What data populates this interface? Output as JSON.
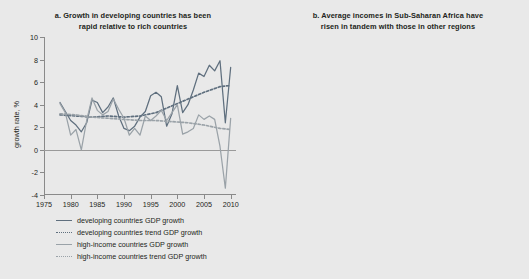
{
  "figure": {
    "background": "#e9e9e9",
    "colors": {
      "developing": "#5f6f7e",
      "developing_trend": "#5f6f7e",
      "high_income": "#9aa2a8",
      "high_income_trend": "#9aa2a8",
      "developing_ex_china_india": "#1a1a1a",
      "sub_saharan_africa": "#b8bfc4",
      "axis": "#8a8a8a"
    }
  },
  "panel_a": {
    "label": "a.",
    "title_line1": "Growth in developing countries has been",
    "title_line2": "rapid relative to rich countries",
    "ylabel": "growth rate, %",
    "legend": [
      {
        "name": "developing-gdp-growth",
        "label": "developing countries GDP growth",
        "style": "solid",
        "color": "#5f6f7e"
      },
      {
        "name": "developing-trend-gdp-growth",
        "label": "developing countries trend GDP growth",
        "style": "dotted",
        "color": "#5f6f7e"
      },
      {
        "name": "high-income-gdp-growth",
        "label": "high-income countries GDP growth",
        "style": "solid",
        "color": "#9aa2a8"
      },
      {
        "name": "high-income-trend-gdp-growth",
        "label": "high-income countries trend GDP growth",
        "style": "dotted",
        "color": "#9aa2a8"
      }
    ]
  },
  "panel_b": {
    "label": "b.",
    "title_line1": "Average incomes in Sub-Saharan Africa have",
    "title_line2": "risen in tandem with those in other regions",
    "ylabel": "% annual change",
    "legend": [
      {
        "name": "developing-countries",
        "label": "developing countries",
        "sub": "",
        "style": "solid",
        "color": "#5f6f7e"
      },
      {
        "name": "developing-countries-excluding-china-and-india",
        "label": "developing countries",
        "sub": "(excluding China and India)",
        "style": "dashed",
        "color": "#1a1a1a"
      },
      {
        "name": "sub-saharan-africa",
        "label": "Sub-Saharan Africa",
        "sub": "",
        "style": "solid",
        "color": "#b8bfc4"
      },
      {
        "name": "high-income-countries",
        "label": "high-income",
        "sub": "countries",
        "style": "solid",
        "color": "#9aa2a8"
      }
    ]
  },
  "chart_data": [
    {
      "type": "line",
      "id": "panel-a",
      "title": "a. Growth in developing countries has been rapid relative to rich countries",
      "xlabel": "",
      "ylabel": "growth rate, %",
      "xlim": [
        1975,
        2011
      ],
      "ylim": [
        -4,
        10
      ],
      "xticks": [
        1975,
        1980,
        1985,
        1990,
        1995,
        2000,
        2005,
        2010
      ],
      "yticks": [
        -4,
        -2,
        0,
        2,
        4,
        6,
        8,
        10
      ],
      "grid": false,
      "zero_line": true,
      "legend_position": "below",
      "series": [
        {
          "name": "developing countries GDP growth",
          "style": "solid",
          "color": "#5f6f7e",
          "x": [
            1978,
            1979,
            1980,
            1981,
            1982,
            1983,
            1984,
            1985,
            1986,
            1987,
            1988,
            1989,
            1990,
            1991,
            1992,
            1993,
            1994,
            1995,
            1996,
            1997,
            1998,
            1999,
            2000,
            2001,
            2002,
            2003,
            2004,
            2005,
            2006,
            2007,
            2008,
            2009,
            2010
          ],
          "values": [
            4.2,
            3.4,
            2.6,
            2.2,
            1.6,
            2.4,
            4.4,
            4.2,
            3.3,
            3.8,
            4.6,
            3.0,
            1.9,
            1.7,
            2.1,
            2.9,
            3.4,
            4.8,
            5.1,
            4.7,
            2.1,
            3.2,
            5.7,
            3.3,
            4.0,
            5.3,
            6.8,
            6.5,
            7.5,
            7.0,
            7.9,
            2.4,
            7.3
          ]
        },
        {
          "name": "developing countries trend GDP growth",
          "style": "dotted",
          "color": "#5f6f7e",
          "x": [
            1978,
            1981,
            1984,
            1987,
            1990,
            1993,
            1996,
            1999,
            2002,
            2005,
            2008,
            2010
          ],
          "values": [
            3.1,
            3.0,
            2.9,
            3.0,
            2.9,
            3.0,
            3.3,
            3.9,
            4.5,
            5.1,
            5.6,
            5.7
          ]
        },
        {
          "name": "high-income countries GDP growth",
          "style": "solid",
          "color": "#9aa2a8",
          "x": [
            1978,
            1979,
            1980,
            1981,
            1982,
            1983,
            1984,
            1985,
            1986,
            1987,
            1988,
            1989,
            1990,
            1991,
            1992,
            1993,
            1994,
            1995,
            1996,
            1997,
            1998,
            1999,
            2000,
            2001,
            2002,
            2003,
            2004,
            2005,
            2006,
            2007,
            2008,
            2009,
            2010
          ],
          "values": [
            4.1,
            3.3,
            1.3,
            1.8,
            0.0,
            2.6,
            4.6,
            3.5,
            3.1,
            3.4,
            4.5,
            3.6,
            2.8,
            1.3,
            1.9,
            1.3,
            3.0,
            2.6,
            3.0,
            3.5,
            2.6,
            3.3,
            4.0,
            1.4,
            1.6,
            1.9,
            3.1,
            2.7,
            3.0,
            2.7,
            0.3,
            -3.4,
            2.8
          ]
        },
        {
          "name": "high-income countries trend GDP growth",
          "style": "dotted",
          "color": "#9aa2a8",
          "x": [
            1978,
            1981,
            1984,
            1987,
            1990,
            1993,
            1996,
            1999,
            2002,
            2005,
            2008,
            2010
          ],
          "values": [
            3.2,
            3.1,
            2.9,
            2.8,
            2.7,
            2.6,
            2.6,
            2.5,
            2.4,
            2.2,
            1.9,
            1.8
          ]
        }
      ]
    },
    {
      "type": "line",
      "id": "panel-b",
      "title": "b. Average incomes in Sub-Saharan Africa have risen in tandem with those in other regions",
      "xlabel": "",
      "ylabel": "% annual change",
      "xlim": [
        1990,
        2010
      ],
      "ylim": [
        -4,
        8
      ],
      "xticks": [
        1990,
        1992,
        1994,
        1996,
        1998,
        2000,
        2002,
        2004,
        2006,
        2008,
        2010
      ],
      "yticks": [
        -4,
        -2,
        0,
        2,
        4,
        6,
        8
      ],
      "grid": false,
      "zero_line": true,
      "legend_position": "below",
      "series": [
        {
          "name": "developing countries",
          "style": "solid",
          "color": "#5f6f7e",
          "x": [
            1990,
            1991,
            1992,
            1993,
            1994,
            1995,
            1996,
            1997,
            1998,
            1999,
            2000,
            2001,
            2002,
            2003,
            2004,
            2005,
            2006,
            2007,
            2008,
            2009,
            2010
          ],
          "values": [
            2.1,
            1.2,
            1.5,
            2.3,
            2.1,
            2.4,
            3.9,
            3.8,
            1.4,
            2.0,
            4.1,
            2.1,
            2.6,
            3.9,
            5.1,
            5.3,
            5.8,
            5.3,
            5.0,
            4.7,
            4.6
          ]
        },
        {
          "name": "developing countries (excluding China and India)",
          "style": "dashed",
          "color": "#1a1a1a",
          "x": [
            1990,
            1991,
            1992,
            1993,
            1994,
            1995,
            1996,
            1997,
            1998,
            1999,
            2000,
            2001,
            2002,
            2003,
            2004,
            2005,
            2006,
            2007,
            2008,
            2009,
            2010
          ],
          "values": [
            -1.2,
            -1.6,
            -1.5,
            -1.5,
            -0.6,
            0.5,
            1.0,
            2.4,
            -0.6,
            -0.2,
            1.5,
            0.6,
            0.1,
            0.1,
            2.1,
            3.0,
            3.6,
            4.3,
            3.3,
            3.1,
            3.1
          ]
        },
        {
          "name": "Sub-Saharan Africa",
          "style": "solid",
          "color": "#b8bfc4",
          "x": [
            1990,
            1991,
            1992,
            1993,
            1994,
            1995,
            1996,
            1997,
            1998,
            1999,
            2000,
            2001,
            2002,
            2003,
            2004,
            2005,
            2006,
            2007,
            2008,
            2009,
            2010
          ],
          "values": [
            -1.8,
            -2.1,
            -3.8,
            -2.4,
            -1.0,
            0.3,
            1.6,
            2.3,
            1.0,
            0.6,
            1.0,
            1.1,
            1.1,
            1.1,
            2.6,
            3.2,
            3.4,
            3.5,
            3.3,
            3.3,
            3.3
          ]
        },
        {
          "name": "high-income countries",
          "style": "solid",
          "color": "#9aa2a8",
          "x": [
            1990,
            1991,
            1992,
            1993,
            1994,
            1995,
            1996,
            1997,
            1998,
            1999,
            2000,
            2001,
            2002,
            2003,
            2004,
            2005,
            2006,
            2007,
            2008,
            2009,
            2010
          ],
          "values": [
            -0.9,
            0.0,
            0.8,
            1.3,
            1.8,
            2.2,
            2.7,
            2.6,
            1.3,
            1.5,
            2.2,
            1.2,
            1.0,
            1.0,
            1.7,
            2.1,
            2.6,
            2.5,
            2.6,
            2.7,
            2.4
          ]
        }
      ]
    }
  ]
}
